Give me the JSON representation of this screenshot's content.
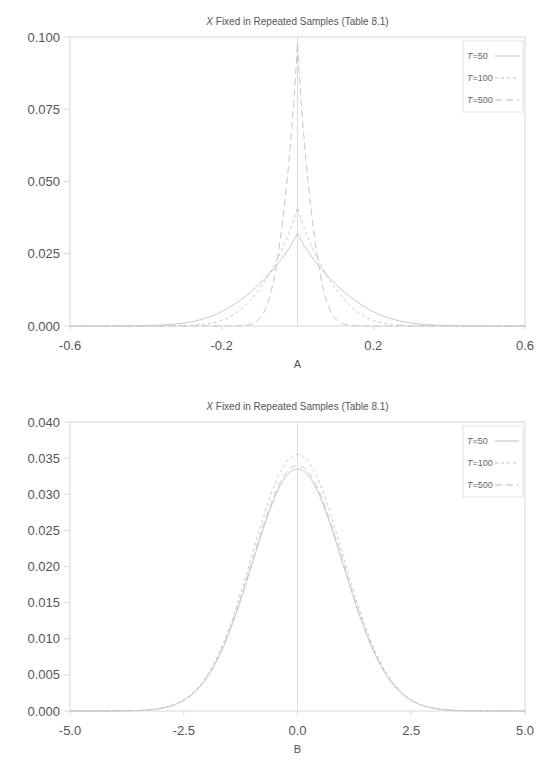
{
  "chart_data": [
    {
      "id": "A",
      "type": "line",
      "title": "X Fixed in Repeated Samples (Table 8.1)",
      "title_italic_prefix": "X",
      "title_rest": " Fixed in Repeated Samples (Table 8.1)",
      "xlabel": "A",
      "ylabel": "",
      "xlim": [
        -0.6,
        0.6
      ],
      "ylim": [
        0.0,
        0.1
      ],
      "xticks": [
        "-0.6",
        "-0.2",
        "0.2",
        "0.6"
      ],
      "xtick_values": [
        -0.6,
        -0.2,
        0.2,
        0.6
      ],
      "yticks": [
        "0.000",
        "0.025",
        "0.050",
        "0.075",
        "0.100"
      ],
      "ytick_values": [
        0.0,
        0.025,
        0.05,
        0.075,
        0.1
      ],
      "grid": false,
      "reference_line_x": 0.0,
      "legend_position": "upper right",
      "series": [
        {
          "name": "T=50",
          "label_italic": "T",
          "label_rest": "=50",
          "style": "solid",
          "peak": 0.032,
          "sd": 0.125
        },
        {
          "name": "T=100",
          "label_italic": "T",
          "label_rest": "=100",
          "style": "dotted",
          "peak": 0.041,
          "sd": 0.09
        },
        {
          "name": "T=500",
          "label_italic": "T",
          "label_rest": "=500",
          "style": "dashed",
          "peak": 0.098,
          "sd": 0.04
        }
      ]
    },
    {
      "id": "B",
      "type": "line",
      "title": "X Fixed in Repeated Samples (Table 8.1)",
      "title_italic_prefix": "X",
      "title_rest": " Fixed in Repeated Samples (Table 8.1)",
      "xlabel": "B",
      "ylabel": "",
      "xlim": [
        -5.0,
        5.0
      ],
      "ylim": [
        0.0,
        0.04
      ],
      "xticks": [
        "-5.0",
        "-2.5",
        "0.0",
        "2.5",
        "5.0"
      ],
      "xtick_values": [
        -5.0,
        -2.5,
        0.0,
        2.5,
        5.0
      ],
      "yticks": [
        "0.000",
        "0.005",
        "0.010",
        "0.015",
        "0.020",
        "0.025",
        "0.030",
        "0.035",
        "0.040"
      ],
      "ytick_values": [
        0.0,
        0.005,
        0.01,
        0.015,
        0.02,
        0.025,
        0.03,
        0.035,
        0.04
      ],
      "grid": false,
      "reference_line_x": 0.0,
      "legend_position": "upper right",
      "series": [
        {
          "name": "T=50",
          "label_italic": "T",
          "label_rest": "=50",
          "style": "solid",
          "peak": 0.0335,
          "sd": 1.0
        },
        {
          "name": "T=100",
          "label_italic": "T",
          "label_rest": "=100",
          "style": "dotted",
          "peak": 0.0355,
          "sd": 1.0
        },
        {
          "name": "T=500",
          "label_italic": "T",
          "label_rest": "=500",
          "style": "dashed",
          "peak": 0.034,
          "sd": 1.0
        }
      ]
    }
  ],
  "colors": {
    "axis": "#d8d8d8",
    "curve": "#c8c8c8",
    "text": "#555555"
  }
}
